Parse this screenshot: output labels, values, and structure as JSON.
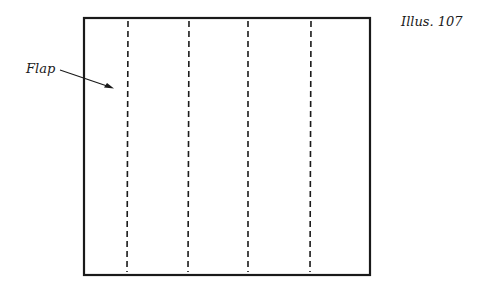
{
  "illustration": {
    "label": "Illus. 107",
    "flap_label": "Flap",
    "colors": {
      "stroke": "#1a1a1a",
      "background": "#ffffff"
    },
    "panel": {
      "x": 84,
      "y": 18,
      "width": 286,
      "height": 257
    },
    "fold_lines_x": [
      128,
      189,
      248,
      310
    ],
    "dash_pattern": "6 4",
    "arrow": {
      "from": [
        60,
        70
      ],
      "to": [
        113,
        88
      ]
    }
  }
}
